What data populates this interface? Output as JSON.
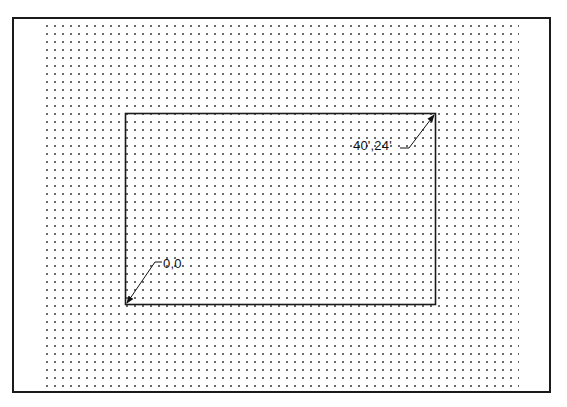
{
  "diagram": {
    "type": "coordinate-grid-drawing",
    "frame": {
      "stroke": "#1a1a1a"
    },
    "grid": {
      "style": "dot",
      "spacing_px": 8,
      "dot_color": "#6a6a6a"
    },
    "rectangle": {
      "stroke": "#1a1a1a",
      "corners": {
        "bottom_left": {
          "label": "0,0"
        },
        "top_right": {
          "label": "40',24'"
        }
      }
    },
    "annotations": [
      {
        "id": "origin",
        "text": "0,0",
        "points_to": "bottom-left corner"
      },
      {
        "id": "extent",
        "text": "40',24'",
        "points_to": "top-right corner"
      }
    ]
  }
}
